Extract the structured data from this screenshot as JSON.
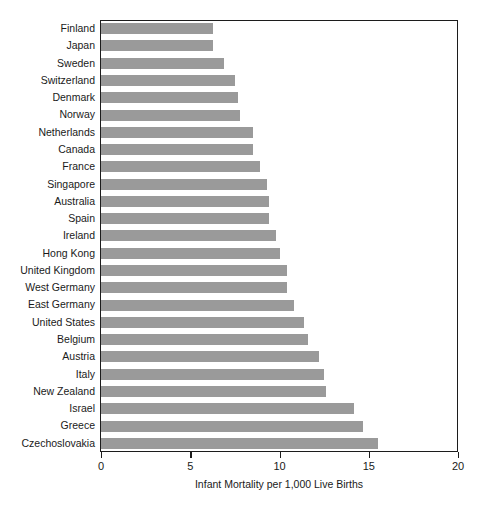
{
  "chart_data": {
    "type": "bar",
    "orientation": "horizontal",
    "title": "",
    "xlabel": "Infant Mortality per 1,000 Live Births",
    "ylabel": "",
    "xlim": [
      0,
      20
    ],
    "xticks": [
      0,
      5,
      10,
      15,
      20
    ],
    "xtick_labels": [
      "0",
      "5",
      "10",
      "15",
      "20"
    ],
    "grid": false,
    "legend": false,
    "bar_color": "#9a9a9a",
    "frame_color": "#1c1c1c",
    "categories": [
      "Finland",
      "Japan",
      "Sweden",
      "Switzerland",
      "Denmark",
      "Norway",
      "Netherlands",
      "Canada",
      "France",
      "Singapore",
      "Australia",
      "Spain",
      "Ireland",
      "Hong Kong",
      "United Kingdom",
      "West Germany",
      "East Germany",
      "United States",
      "Belgium",
      "Austria",
      "Italy",
      "New Zealand",
      "Israel",
      "Greece",
      "Czechoslovakia"
    ],
    "values": [
      6.3,
      6.3,
      6.9,
      7.5,
      7.7,
      7.8,
      8.5,
      8.5,
      8.9,
      9.3,
      9.4,
      9.4,
      9.8,
      10.0,
      10.4,
      10.4,
      10.8,
      11.4,
      11.6,
      12.2,
      12.5,
      12.6,
      14.2,
      14.7,
      15.5
    ]
  }
}
